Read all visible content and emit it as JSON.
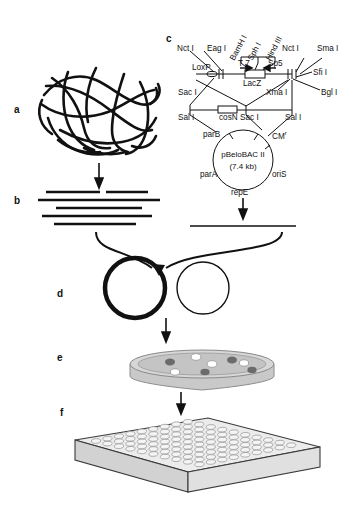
{
  "figure": {
    "panels": [
      {
        "id": "a",
        "label": "a",
        "description": "tangled-genomic-dna"
      },
      {
        "id": "b",
        "label": "b",
        "description": "partially-digested-dna-fragments"
      },
      {
        "id": "c",
        "label": "c",
        "description": "pBeloBAC-II-vector-map"
      },
      {
        "id": "d",
        "label": "d",
        "description": "ligation-circles"
      },
      {
        "id": "e",
        "label": "e",
        "description": "petri-dish-colonies"
      },
      {
        "id": "f",
        "label": "f",
        "description": "microtiter-plate"
      }
    ]
  },
  "vector_map": {
    "plasmid_name": "pBeloBAC II",
    "plasmid_size": "(7.4 kb)",
    "promoters": [
      "T 7",
      "Sp5"
    ],
    "reporter": "LacZ",
    "recombination_site": "LoxP",
    "cos_site": "cosN",
    "genes": {
      "parB": "parB",
      "parA": "parA",
      "repE": "repE",
      "oriS": "oriS",
      "cm": "CM",
      "cm_sup": "r"
    },
    "enzymes_top_rotated": [
      "BamH I",
      "Sph I",
      "Hind III"
    ],
    "enzymes_upper_left": [
      "Nct I",
      "Eag I"
    ],
    "enzymes_upper_right": [
      "Nct I",
      "Sma I"
    ],
    "enzymes_mid_right": [
      "Sfi I",
      "Bgl I"
    ],
    "enzymes_lower": [
      "Xma I"
    ],
    "enzymes_linear_left": [
      "Sac I",
      "Sal I"
    ],
    "enzymes_linear_right": [
      "Sac I",
      "Sal I"
    ]
  },
  "colors": {
    "ink": "#111111",
    "dish_fill": "#cccccc",
    "dish_rim": "#e2e2e2",
    "colony_dark": "#6b6b6b",
    "colony_light": "#ffffff",
    "plate_top": "#e8e8e8",
    "plate_side": "#d0d0d0",
    "plate_front": "#dcdcdc"
  }
}
